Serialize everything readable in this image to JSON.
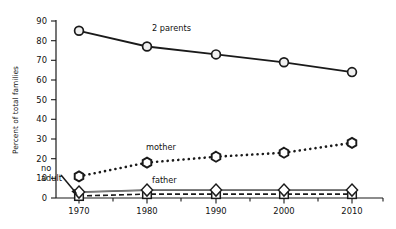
{
  "chart_data": {
    "type": "line",
    "title": "",
    "xlabel": "",
    "ylabel": "Percent of total families",
    "x": [
      1970,
      1980,
      1990,
      2000,
      2010
    ],
    "xticklabels": [
      "1970",
      "1980",
      "1990",
      "2000",
      "2010"
    ],
    "yticklabels": [
      "0",
      "10",
      "20",
      "30",
      "40",
      "50",
      "60",
      "70",
      "80",
      "90"
    ],
    "yticks": [
      0,
      10,
      20,
      30,
      40,
      50,
      60,
      70,
      80,
      90
    ],
    "ylim": [
      0,
      90
    ],
    "xlim": [
      1965,
      2015
    ],
    "grid": false,
    "legend_position": "inline-annotations",
    "series": [
      {
        "name": "2 parents",
        "label": "2 parents",
        "values": [
          85,
          77,
          73,
          69,
          64
        ],
        "marker": "circle",
        "linestyle": "solid",
        "color": "#1a1a1a"
      },
      {
        "name": "mother",
        "label": "mother",
        "values": [
          11,
          18,
          21,
          23,
          28
        ],
        "marker": "hexagon",
        "linestyle": "dotted",
        "color": "#1a1a1a"
      },
      {
        "name": "father",
        "label": "father",
        "values": [
          3,
          4,
          4,
          4,
          4
        ],
        "marker": "diamond",
        "linestyle": "solid",
        "color": "#4a4a4a"
      },
      {
        "name": "no adult",
        "label": "no adult",
        "values": [
          1,
          2,
          2,
          2,
          2
        ],
        "marker": "square",
        "linestyle": "dashed",
        "color": "#1a1a1a"
      }
    ],
    "annotations": [
      {
        "text": "2 parents",
        "target_series": "2 parents"
      },
      {
        "text": "mother",
        "target_series": "mother"
      },
      {
        "text": "father",
        "target_series": "father"
      },
      {
        "text": "no adult",
        "target_series": "no adult",
        "has_arrow": true
      }
    ]
  },
  "colors": {
    "axis": "#1a1a1a",
    "background": "#ffffff",
    "marker_fill": "#ffffff",
    "two_parents": "#1a1a1a",
    "mother": "#1a1a1a",
    "father": "#4a4a4a",
    "no_adult": "#1a1a1a"
  }
}
